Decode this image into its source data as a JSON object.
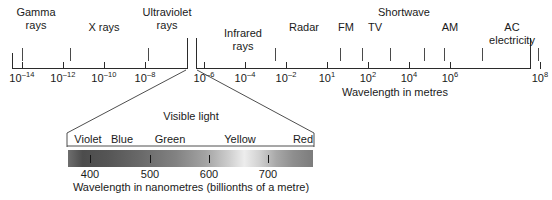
{
  "chart_data": {
    "type": "scatter",
    "xlabel": "Wavelength in metres",
    "ylabel": "",
    "axis_note": "Logarithmic wavelength axis with a break between 10^-6 and just after, where the visible-light region is expanded below.",
    "scale_ticks": [
      {
        "label": "10",
        "exponent": "–14",
        "x": 22
      },
      {
        "label": "10",
        "exponent": "–12",
        "x": 63
      },
      {
        "label": "10",
        "exponent": "–10",
        "x": 104
      },
      {
        "label": "10",
        "exponent": "–8",
        "x": 145
      },
      {
        "label": "10",
        "exponent": "–6",
        "x": 204
      },
      {
        "label": "10",
        "exponent": "–4",
        "x": 245
      },
      {
        "label": "10",
        "exponent": "–2",
        "x": 286
      },
      {
        "label": "10",
        "exponent": "1",
        "x": 327
      },
      {
        "label": "10",
        "exponent": "2",
        "x": 368
      },
      {
        "label": "10",
        "exponent": "4",
        "x": 409
      },
      {
        "label": "10",
        "exponent": "6",
        "x": 450
      },
      {
        "label": "10",
        "exponent": "8",
        "x": 540
      }
    ],
    "bands": [
      {
        "name": "Gamma rays",
        "label_lines": [
          "Gamma",
          "rays"
        ],
        "label_x": 36,
        "label_y": 6,
        "ticks": [
          22
        ]
      },
      {
        "name": "X rays",
        "label_lines": [
          "X rays"
        ],
        "label_x": 104,
        "label_y": 21,
        "ticks": [
          70
        ]
      },
      {
        "name": "Ultraviolet rays",
        "label_lines": [
          "Ultraviolet",
          "rays"
        ],
        "label_x": 167,
        "label_y": 6,
        "ticks": [
          148
        ]
      },
      {
        "name": "Infrared rays",
        "label_lines": [
          "Infrared",
          "rays"
        ],
        "label_x": 243,
        "label_y": 27,
        "ticks": [
          275
        ]
      },
      {
        "name": "Radar",
        "label_lines": [
          "Radar"
        ],
        "label_x": 304,
        "label_y": 21,
        "ticks": []
      },
      {
        "name": "FM",
        "label_lines": [
          "FM"
        ],
        "label_x": 346,
        "label_y": 21,
        "ticks": [
          340
        ]
      },
      {
        "name": "TV",
        "label_lines": [
          "TV"
        ],
        "label_x": 375,
        "label_y": 21,
        "ticks": [
          362
        ]
      },
      {
        "name": "Shortwave",
        "label_lines": [
          "Shortwave"
        ],
        "label_x": 404,
        "label_y": 6,
        "ticks": [
          390,
          424
        ]
      },
      {
        "name": "AM",
        "label_lines": [
          "AM"
        ],
        "label_x": 450,
        "label_y": 21,
        "ticks": [
          444
        ]
      },
      {
        "name": "AC electricity",
        "label_lines": [
          "AC",
          "electricity"
        ],
        "label_x": 512,
        "label_y": 21,
        "ticks": [
          482,
          538
        ]
      }
    ],
    "visible_light": {
      "title": "Visible light",
      "xlabel": "Wavelength in nanometres (billionths of a metre)",
      "range_nm": [
        380,
        780
      ],
      "color_labels": [
        {
          "name": "Violet",
          "x": 88
        },
        {
          "name": "Blue",
          "x": 122
        },
        {
          "name": "Green",
          "x": 170
        },
        {
          "name": "Yellow",
          "x": 240
        },
        {
          "name": "Red",
          "x": 303
        }
      ],
      "nm_ticks": [
        {
          "label": "400",
          "x": 90
        },
        {
          "label": "500",
          "x": 150
        },
        {
          "label": "600",
          "x": 209
        },
        {
          "label": "700",
          "x": 268
        }
      ]
    },
    "legend": [],
    "grid": false
  },
  "main_axis": {
    "caption": "Wavelength in metres",
    "caption_x": 395
  }
}
